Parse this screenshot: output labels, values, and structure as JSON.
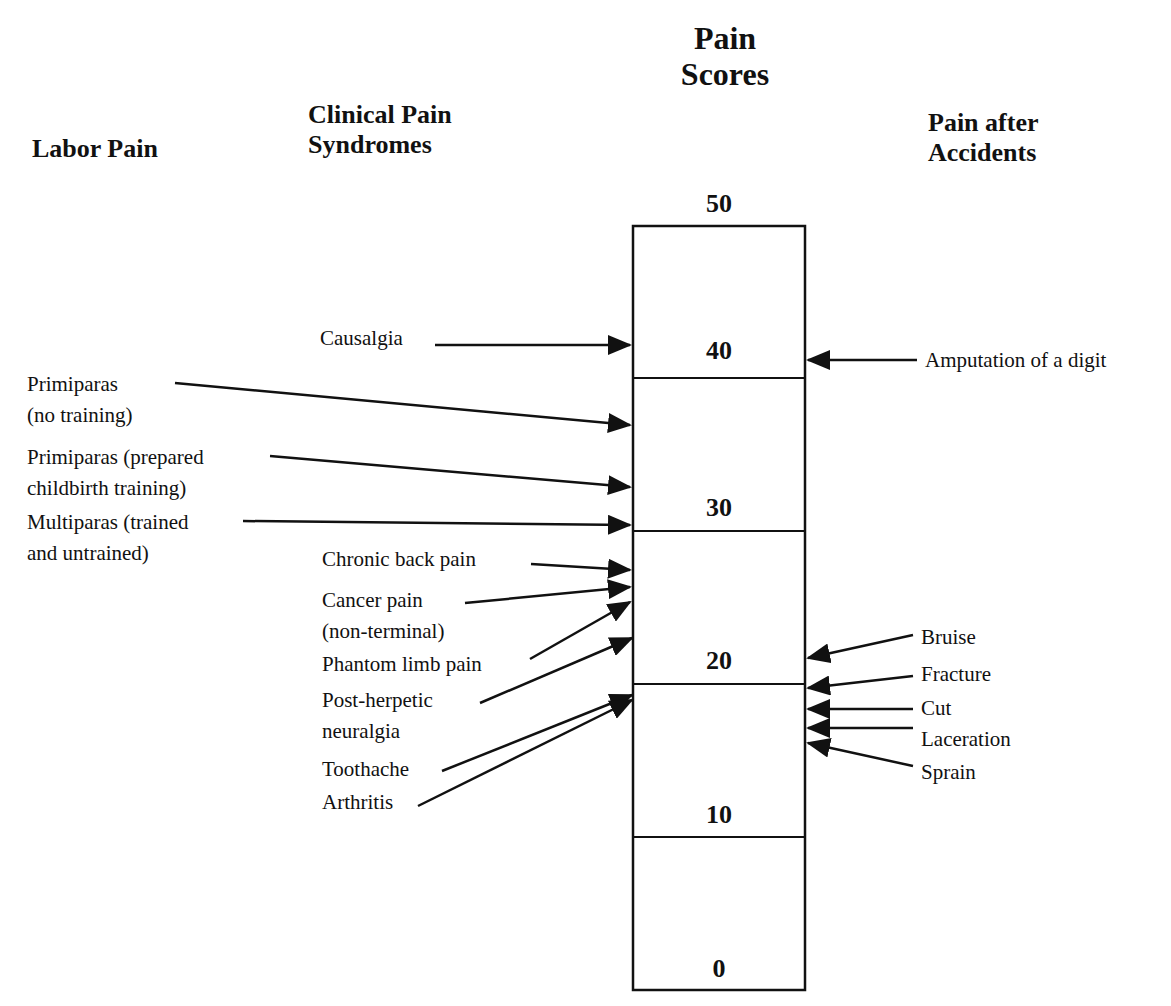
{
  "headers": {
    "labor_pain": "Labor Pain",
    "clinical_line1": "Clinical Pain",
    "clinical_line2": "Syndromes",
    "scores_line1": "Pain",
    "scores_line2": "Scores",
    "accidents_line1": "Pain after",
    "accidents_line2": "Accidents"
  },
  "scale": {
    "min": 0,
    "max": 50,
    "ticks": [
      "50",
      "40",
      "30",
      "20",
      "10",
      "0"
    ]
  },
  "labor_pain": [
    {
      "line1": "Primiparas",
      "line2": "(no training)",
      "approx_score": 36
    },
    {
      "line1": "Primiparas (prepared",
      "line2": "childbirth training)",
      "approx_score": 33
    },
    {
      "line1": "Multiparas (trained",
      "line2": "and untrained)",
      "approx_score": 30.5
    }
  ],
  "clinical_pain": [
    {
      "line1": "Causalgia",
      "approx_score": 41
    },
    {
      "line1": "Chronic back pain",
      "approx_score": 27.5
    },
    {
      "line1": "Cancer pain",
      "line2": "(non-terminal)",
      "approx_score": 26.5
    },
    {
      "line1": "Phantom limb pain",
      "approx_score": 25.5
    },
    {
      "line1": "Post-herpetic",
      "line2": "neuralgia",
      "approx_score": 23
    },
    {
      "line1": "Toothache",
      "approx_score": 19.5
    },
    {
      "line1": "Arthritis",
      "approx_score": 19
    }
  ],
  "accident_pain": [
    {
      "line1": "Amputation of a digit",
      "approx_score": 40
    },
    {
      "line1": "Bruise",
      "approx_score": 21.5
    },
    {
      "line1": "Fracture",
      "approx_score": 19.5
    },
    {
      "line1": "Cut",
      "approx_score": 18
    },
    {
      "line1": "Laceration",
      "approx_score": 17
    },
    {
      "line1": "Sprain",
      "approx_score": 16.5
    }
  ]
}
